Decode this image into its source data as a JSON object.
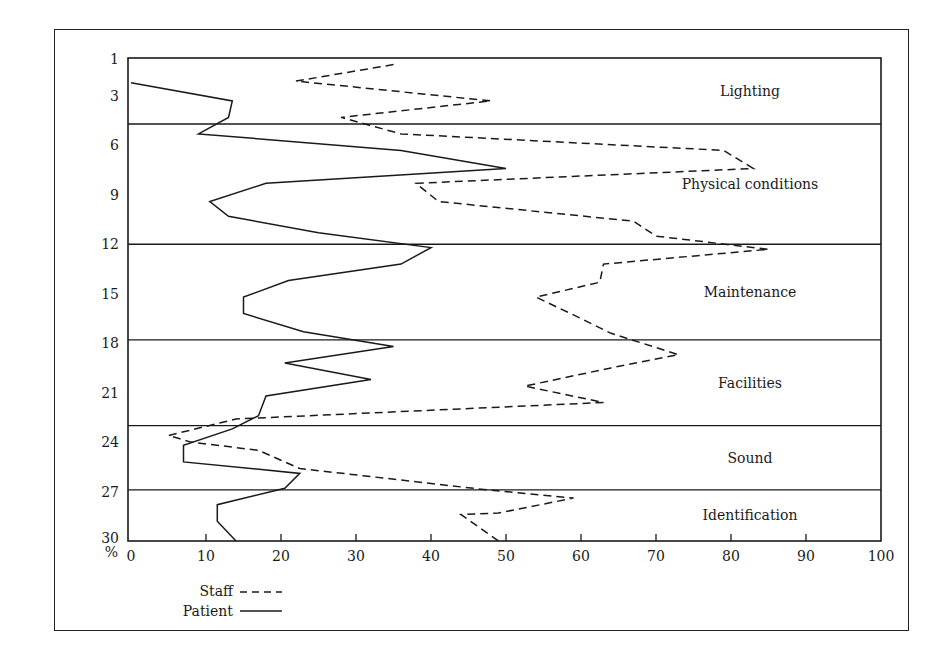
{
  "chart_data": {
    "type": "line",
    "orientation": "horizontal-profile",
    "title": "",
    "xlabel": "%",
    "ylabel": "",
    "xlim": [
      0,
      100
    ],
    "x_ticks": [
      0,
      10,
      20,
      30,
      40,
      50,
      60,
      70,
      80,
      90,
      100
    ],
    "y_tick_labels": [
      "1",
      "3",
      "6",
      "9",
      "12",
      "15",
      "18",
      "21",
      "24",
      "27",
      "30"
    ],
    "y_tick_rows": [
      1,
      3,
      6,
      9,
      12,
      15,
      18,
      21,
      24,
      27,
      30
    ],
    "grid": false,
    "legend_position": "bottom-left",
    "sections": [
      {
        "label": "Lighting",
        "row_start": 1,
        "row_end": 4.7
      },
      {
        "label": "Physical conditions",
        "row_start": 4.7,
        "row_end": 12
      },
      {
        "label": "Maintenance",
        "row_start": 12,
        "row_end": 17.8
      },
      {
        "label": "Facilities",
        "row_start": 17.8,
        "row_end": 23
      },
      {
        "label": "Sound",
        "row_start": 23,
        "row_end": 26.9
      },
      {
        "label": "Identification",
        "row_start": 26.9,
        "row_end": 30
      }
    ],
    "series": [
      {
        "name": "Staff",
        "style": "dashed",
        "points": [
          [
            35,
            1.1
          ],
          [
            22,
            2.1
          ],
          [
            48,
            3.3
          ],
          [
            28,
            4.3
          ],
          [
            36,
            5.3
          ],
          [
            79,
            6.3
          ],
          [
            83,
            7.4
          ],
          [
            38,
            8.3
          ],
          [
            41,
            9.4
          ],
          [
            67,
            10.6
          ],
          [
            70,
            11.5
          ],
          [
            85,
            12.3
          ],
          [
            63,
            13.2
          ],
          [
            62.5,
            14.3
          ],
          [
            54,
            15.2
          ],
          [
            60,
            16.5
          ],
          [
            64,
            17.4
          ],
          [
            73,
            18.7
          ],
          [
            64,
            19.5
          ],
          [
            52.5,
            20.6
          ],
          [
            63,
            21.6
          ],
          [
            14,
            22.6
          ],
          [
            5,
            23.6
          ],
          [
            8,
            24.0
          ],
          [
            17,
            24.5
          ],
          [
            22.5,
            25.6
          ],
          [
            47.5,
            26.9
          ],
          [
            59,
            27.4
          ],
          [
            49,
            28.3
          ],
          [
            44,
            28.4
          ],
          [
            49,
            30.0
          ]
        ]
      },
      {
        "name": "Patient",
        "style": "solid",
        "points": [
          [
            0,
            2.2
          ],
          [
            13.5,
            3.3
          ],
          [
            13,
            4.3
          ],
          [
            9,
            5.3
          ],
          [
            36,
            6.3
          ],
          [
            50,
            7.4
          ],
          [
            18,
            8.3
          ],
          [
            10.5,
            9.4
          ],
          [
            13,
            10.3
          ],
          [
            25,
            11.3
          ],
          [
            40,
            12.2
          ],
          [
            36,
            13.2
          ],
          [
            21,
            14.2
          ],
          [
            15,
            15.2
          ],
          [
            15,
            16.2
          ],
          [
            23,
            17.3
          ],
          [
            35,
            18.2
          ],
          [
            20.5,
            19.2
          ],
          [
            32,
            20.2
          ],
          [
            18,
            21.2
          ],
          [
            17,
            22.4
          ],
          [
            13.5,
            23.2
          ],
          [
            7,
            24.2
          ],
          [
            7,
            25.2
          ],
          [
            22.5,
            25.9
          ],
          [
            20.5,
            26.8
          ],
          [
            11.5,
            27.8
          ],
          [
            11.5,
            28.8
          ],
          [
            14,
            30.0
          ]
        ]
      }
    ]
  },
  "axis": {
    "percent_symbol": "%"
  },
  "legend": {
    "staff_label": "Staff",
    "patient_label": "Patient"
  },
  "colors": {
    "ink": "#1a1a1a",
    "background": "#ffffff"
  }
}
